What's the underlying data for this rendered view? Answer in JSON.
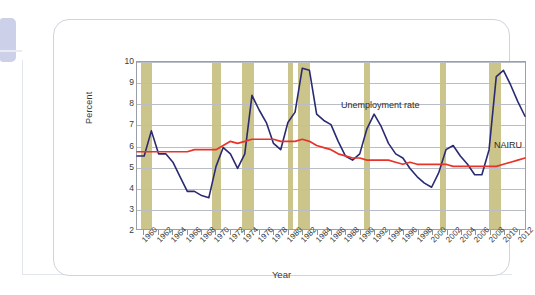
{
  "figure": {
    "y_axis_title": "Percent",
    "x_axis_title": "Year"
  },
  "annotations": {
    "unemployment": "Unemployment rate",
    "nairu": "NAIRU"
  },
  "colors": {
    "unemployment_line": "#2a2a72",
    "nairu_line": "#e8332a",
    "recession_band": "#cbc58b",
    "gridline": "#b9bec6",
    "axis": "#9aa0a8",
    "card_border": "#cfd3db",
    "tab_accent": "#ccd0e8"
  },
  "chart_data": {
    "type": "line",
    "title": "",
    "xlabel": "Year",
    "ylabel": "Percent",
    "xlim": [
      1959,
      2013
    ],
    "ylim": [
      2,
      10
    ],
    "grid": true,
    "legend": "inline-annotations",
    "y_ticks": [
      2,
      3,
      4,
      5,
      6,
      7,
      8,
      9,
      10
    ],
    "x_ticks": [
      1960,
      1962,
      1964,
      1966,
      1968,
      1970,
      1972,
      1974,
      1976,
      1978,
      1980,
      1982,
      1984,
      1986,
      1988,
      1990,
      1992,
      1994,
      1996,
      1998,
      2000,
      2002,
      2004,
      2006,
      2008,
      2010,
      2012
    ],
    "x_tick_labels": [
      "1960",
      "1962",
      "1964",
      "1966",
      "1968",
      "1970",
      "1972",
      "1974",
      "1976",
      "1978",
      "1980",
      "1982",
      "1984",
      "1986",
      "1988",
      "1990",
      "1992",
      "1994",
      "1996",
      "1998",
      "2000",
      "2002",
      "2004",
      "2006",
      "2008",
      "2010",
      "2012"
    ],
    "x": [
      1959,
      1960,
      1961,
      1962,
      1963,
      1964,
      1965,
      1966,
      1967,
      1968,
      1969,
      1970,
      1971,
      1972,
      1973,
      1974,
      1975,
      1976,
      1977,
      1978,
      1979,
      1980,
      1981,
      1982,
      1983,
      1984,
      1985,
      1986,
      1987,
      1988,
      1989,
      1990,
      1991,
      1992,
      1993,
      1994,
      1995,
      1996,
      1997,
      1998,
      1999,
      2000,
      2001,
      2002,
      2003,
      2004,
      2005,
      2006,
      2007,
      2008,
      2009,
      2010,
      2011,
      2012,
      2013
    ],
    "series": [
      {
        "name": "Unemployment rate",
        "color": "#2a2a72",
        "values": [
          5.5,
          5.5,
          6.7,
          5.6,
          5.6,
          5.2,
          4.5,
          3.8,
          3.8,
          3.6,
          3.5,
          5.0,
          5.9,
          5.6,
          4.9,
          5.6,
          8.4,
          7.7,
          7.1,
          6.1,
          5.8,
          7.1,
          7.6,
          9.7,
          9.6,
          7.5,
          7.2,
          7.0,
          6.2,
          5.5,
          5.3,
          5.6,
          6.8,
          7.5,
          6.9,
          6.1,
          5.6,
          5.4,
          4.9,
          4.5,
          4.2,
          4.0,
          4.7,
          5.8,
          6.0,
          5.5,
          5.1,
          4.6,
          4.6,
          5.8,
          9.3,
          9.6,
          8.9,
          8.1,
          7.4
        ]
      },
      {
        "name": "NAIRU",
        "color": "#e8332a",
        "values": [
          5.7,
          5.7,
          5.7,
          5.7,
          5.7,
          5.7,
          5.7,
          5.7,
          5.8,
          5.8,
          5.8,
          5.8,
          6.0,
          6.2,
          6.1,
          6.2,
          6.3,
          6.3,
          6.3,
          6.3,
          6.2,
          6.2,
          6.2,
          6.3,
          6.2,
          6.0,
          5.9,
          5.8,
          5.6,
          5.5,
          5.4,
          5.4,
          5.3,
          5.3,
          5.3,
          5.3,
          5.2,
          5.1,
          5.2,
          5.1,
          5.1,
          5.1,
          5.1,
          5.1,
          5.0,
          5.0,
          5.0,
          5.0,
          5.0,
          5.0,
          5.0,
          5.1,
          5.2,
          5.3,
          5.4
        ]
      }
    ],
    "shaded_regions": {
      "label": "recessions",
      "color": "#cbc58b",
      "spans": [
        [
          1959.6,
          1961.1
        ],
        [
          1969.4,
          1970.6
        ],
        [
          1973.6,
          1975.2
        ],
        [
          1979.9,
          1980.6
        ],
        [
          1981.3,
          1982.9
        ],
        [
          1990.4,
          1991.2
        ],
        [
          2000.9,
          2001.8
        ],
        [
          2007.8,
          2009.4
        ]
      ]
    }
  }
}
